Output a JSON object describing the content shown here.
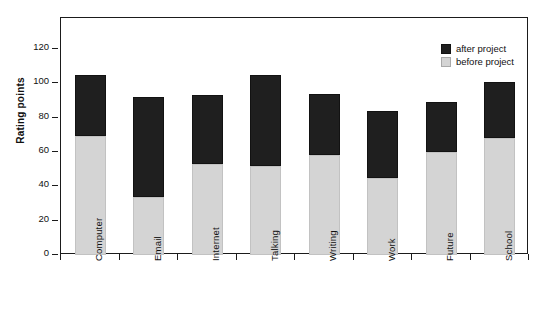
{
  "chart_data": {
    "type": "bar",
    "subtype": "stacked-vertical",
    "title": "",
    "xlabel": "",
    "ylabel": "Rating points",
    "ylim": [
      0,
      138
    ],
    "yticks": [
      0,
      20,
      40,
      60,
      80,
      100,
      120
    ],
    "ytick_labels": [
      "0",
      "20",
      "40",
      "60",
      "80",
      "100",
      "120"
    ],
    "grid": false,
    "legend_position": "top-right",
    "categories": [
      "Computer",
      "Email",
      "Internet",
      "Talking",
      "Writing",
      "Work",
      "Future",
      "School"
    ],
    "series": [
      {
        "name": "before project",
        "color": "#d4d4d4",
        "values": [
          69,
          34,
          53,
          52,
          58,
          45,
          60,
          68
        ]
      },
      {
        "name": "after project",
        "color": "#1f1f1f",
        "values": [
          36,
          58,
          40,
          53,
          36,
          39,
          29,
          33
        ]
      }
    ],
    "stacked_totals": [
      105,
      92,
      93,
      105,
      94,
      84,
      89,
      101
    ]
  },
  "legend": {
    "items": [
      {
        "label": "after project",
        "swatch": "black-swatch-icon"
      },
      {
        "label": "before project",
        "swatch": "gray-swatch-icon"
      }
    ]
  },
  "axis": {
    "y_title": "Rating points"
  }
}
